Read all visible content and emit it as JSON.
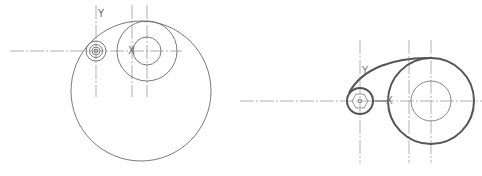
{
  "figure_left": {
    "axis_labels": {
      "y": "Y",
      "x": "X"
    },
    "colors": {
      "line": "#6a6a6a",
      "centerline": "#9a9a9a"
    },
    "centerline_h": {
      "y": 51,
      "x1": 10,
      "x2": 182
    },
    "verticals": [
      {
        "x": 96,
        "y1": 5,
        "y2": 97
      },
      {
        "x": 132,
        "y1": 5,
        "y2": 97
      },
      {
        "x": 147,
        "y1": 5,
        "y2": 97
      }
    ],
    "small_hub": {
      "cx": 96,
      "cy": 51,
      "r_outer": 10,
      "r_mid": 6.5,
      "r_inner": 4,
      "square": 3
    },
    "medium_circle": {
      "cx": 147,
      "cy": 51,
      "r": 30,
      "r_inner": 14
    },
    "large_circle": {
      "cx": 141,
      "cy": 91,
      "r": 70
    }
  },
  "figure_right": {
    "axis_labels": {
      "y": "Y",
      "x": "X"
    },
    "colors": {
      "outline": "#555555",
      "line": "#7a7a7a",
      "centerline": "#a0a0a0"
    },
    "centerline_h": {
      "y": 101,
      "x1": 240,
      "x2": 482
    },
    "verticals": [
      {
        "x": 360,
        "y1": 40,
        "y2": 163
      },
      {
        "x": 409,
        "y1": 40,
        "y2": 163
      },
      {
        "x": 431,
        "y1": 40,
        "y2": 163
      }
    ],
    "small_hub": {
      "cx": 360,
      "cy": 101,
      "r_outer": 13,
      "hex_r": 8,
      "square": 3
    },
    "large_circle": {
      "cx": 431,
      "cy": 101,
      "r": 43,
      "r_inner": 20
    },
    "tangent_curve": "M 349 93 C 362 68, 395 57, 432 58"
  }
}
